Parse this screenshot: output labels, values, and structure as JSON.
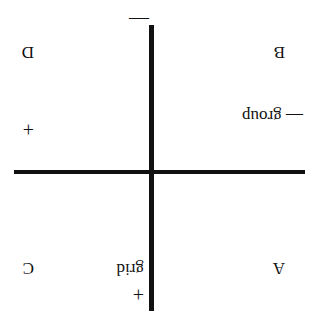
{
  "diagram": {
    "orientation": "rotated 180 degrees",
    "vertical_axis": {
      "label": "grid",
      "top_sign": "+",
      "bottom_sign": "—"
    },
    "horizontal_axis": {
      "label": "— group",
      "left_sign": "—",
      "right_sign": "+"
    },
    "quadrants": {
      "top_left": "A",
      "bottom_left": "B",
      "top_right": "C",
      "bottom_right": "D"
    },
    "colors": {
      "line": "#111111",
      "background": "#ffffff"
    }
  }
}
